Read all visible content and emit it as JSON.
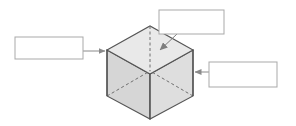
{
  "figure": {
    "title": "",
    "type": "labeled-diagram",
    "background_color": "#ffffff",
    "width": 296,
    "height": 126
  },
  "shape": {
    "name": "cube",
    "projection": "isometric",
    "edge_color": "#555555",
    "hidden_edge_color": "#777777",
    "hidden_edge_style": "dashed",
    "faces": {
      "top": {
        "name": "top-face",
        "fill": "#e9e9e9"
      },
      "front_left": {
        "name": "front-left-face",
        "fill": "#d6d6d6"
      },
      "front_right": {
        "name": "front-right-face",
        "fill": "#dededf"
      }
    },
    "vertices": {
      "top_left": [
        107,
        50
      ],
      "top_back": [
        150,
        26
      ],
      "top_right": [
        193,
        50
      ],
      "top_front": [
        150,
        74
      ],
      "bottom_left": [
        107,
        96
      ],
      "bottom_front": [
        150,
        119
      ],
      "bottom_right": [
        193,
        96
      ],
      "bottom_back": [
        150,
        71
      ]
    }
  },
  "callouts": [
    {
      "id": "callout-top",
      "name": "callout-box-top",
      "text": "",
      "placeholder": "",
      "border_color": "#a9a9a9",
      "fill": "#ffffff",
      "x": 159,
      "y": 10,
      "width": 65,
      "height": 24,
      "leader": {
        "name": "leader-line-top",
        "from": [
          175,
          34
        ],
        "to": [
          159,
          51
        ],
        "arrowhead": "filled-triangle",
        "color": "#8a8a8a"
      }
    },
    {
      "id": "callout-left",
      "name": "callout-box-left",
      "text": "",
      "placeholder": "",
      "border_color": "#a9a9a9",
      "fill": "#ffffff",
      "x": 15,
      "y": 37,
      "width": 68,
      "height": 22,
      "leader": {
        "name": "leader-line-left",
        "from": [
          83,
          51
        ],
        "to": [
          106,
          51
        ],
        "arrowhead": "filled-triangle",
        "color": "#8a8a8a"
      }
    },
    {
      "id": "callout-right",
      "name": "callout-box-right",
      "text": "",
      "placeholder": "",
      "border_color": "#a9a9a9",
      "fill": "#ffffff",
      "x": 209,
      "y": 62,
      "width": 68,
      "height": 25,
      "leader": {
        "name": "leader-line-right",
        "from": [
          209,
          72
        ],
        "to": [
          194,
          72
        ],
        "arrowhead": "filled-triangle",
        "color": "#8a8a8a"
      }
    }
  ]
}
